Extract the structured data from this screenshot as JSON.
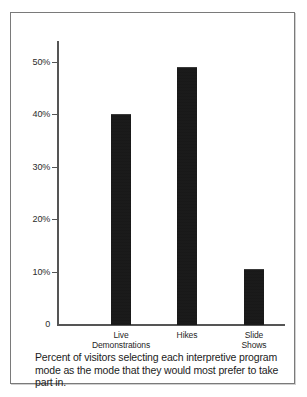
{
  "chart_data": {
    "type": "bar",
    "title": "",
    "categories": [
      "Live Demonstrations",
      "Hikes",
      "Slide Shows"
    ],
    "values": [
      40,
      49,
      10.5
    ],
    "xlabel": "",
    "ylabel": "",
    "ylim": [
      0,
      54
    ],
    "grid": false,
    "legend": null,
    "y_ticks": [
      {
        "value": 50,
        "label": "50%"
      },
      {
        "value": 40,
        "label": "40%"
      },
      {
        "value": 30,
        "label": "30%"
      },
      {
        "value": 20,
        "label": "20%"
      },
      {
        "value": 10,
        "label": "10%"
      },
      {
        "value": 0,
        "label": "0"
      }
    ],
    "category_lines": [
      [
        "Live",
        "Demonstrations"
      ],
      [
        "Hikes",
        ""
      ],
      [
        "Slide",
        "Shows"
      ]
    ],
    "bar_color": "#1a1a1a",
    "axis_color": "#555555"
  },
  "caption": {
    "text": "Percent of visitors selecting each interpretive program mode as the mode that they would most prefer to take part in."
  }
}
